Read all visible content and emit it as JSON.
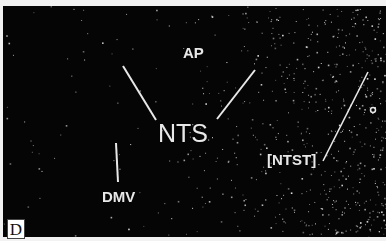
{
  "figure": {
    "panel_label": "D",
    "labels": {
      "ap": "AP",
      "nts": "NTS",
      "dmv": "DMV",
      "ntst": "[NTST]"
    },
    "colors": {
      "background": "#050505",
      "label": "#e8e8e8",
      "page": "#f2f2f2"
    }
  }
}
